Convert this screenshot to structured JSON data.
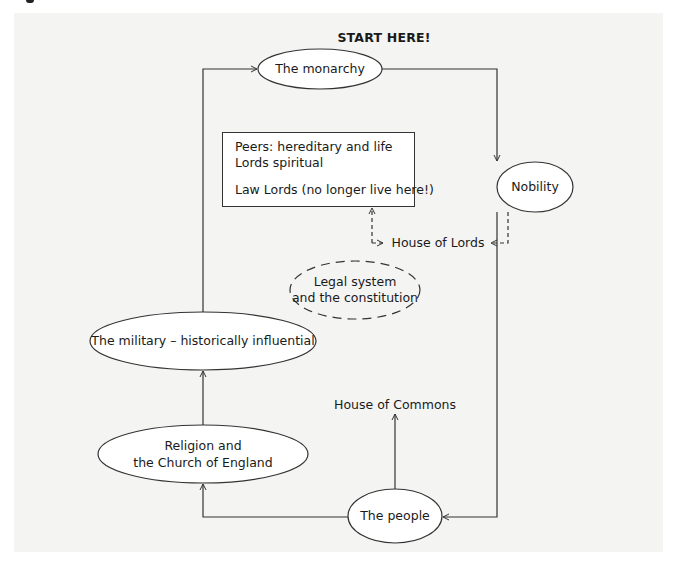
{
  "title": "START HERE!",
  "nodes": {
    "monarchy": "The monarchy",
    "nobility": "Nobility",
    "military": "The military – historically influential",
    "religion_line1": "Religion and",
    "religion_line2": "the Church of England",
    "people": "The people",
    "legal_line1": "Legal system",
    "legal_line2": "and the constitution"
  },
  "lords_box": {
    "line1": "Peers: hereditary and life",
    "line2": "Lords spiritual",
    "line3": "Law Lords (no longer live here!)"
  },
  "labels": {
    "house_of_lords": "House of Lords",
    "house_of_commons": "House of Commons"
  },
  "colors": {
    "panel_background": "#f4f4f3",
    "line": "#333333",
    "node_fill": "#ffffff"
  }
}
